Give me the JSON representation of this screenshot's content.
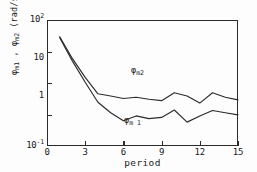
{
  "chart_data": {
    "type": "line",
    "title": "",
    "subtitle": "",
    "xlabel": "period",
    "ylabel": "φm1 , φm2 (rad/s)²",
    "yscale": "log",
    "xscale": "linear",
    "xlim": [
      0,
      15
    ],
    "ylim": [
      0.1,
      100
    ],
    "xticks": [
      0,
      3,
      6,
      9,
      12,
      15
    ],
    "xticklabels": [
      "0",
      "3",
      "6",
      "9",
      "12",
      "15"
    ],
    "yticks": [
      0.1,
      1,
      10,
      100
    ],
    "yticklabels": [
      "10-1",
      "1",
      "10",
      "102"
    ],
    "grid": false,
    "legend_position": "inline-annotation",
    "x": [
      1,
      2,
      3,
      4,
      5,
      6,
      7,
      8,
      9,
      10,
      11,
      12,
      13,
      14,
      15
    ],
    "series": [
      {
        "name": "φm2",
        "label": "φm2",
        "color": "#2b2b2b",
        "values": [
          40,
          12,
          4.3,
          1.75,
          1.55,
          1.35,
          1.45,
          1.3,
          1.2,
          1.85,
          1.55,
          1.05,
          1.85,
          1.45,
          1.25
        ]
      },
      {
        "name": "φm1",
        "label": "φm1",
        "color": "#2b2b2b",
        "values": [
          38,
          10.5,
          3.3,
          1.1,
          0.62,
          0.4,
          0.52,
          0.45,
          0.48,
          0.72,
          0.37,
          0.52,
          0.7,
          0.62,
          0.55
        ]
      }
    ],
    "annotations": [
      {
        "text": "φm2",
        "series": "φm2",
        "x": 7,
        "y": 2.6
      },
      {
        "text": "φm1",
        "series": "φm1",
        "x": 6.6,
        "y": 0.26
      }
    ]
  },
  "axes": {
    "x_axis_label": "period",
    "x_tick_labels": [
      "0",
      "3",
      "6",
      "9",
      "12",
      "15"
    ],
    "y_tick_labels": [
      {
        "mantissa": "10",
        "exponent": "2"
      },
      {
        "mantissa": "10",
        "exponent": ""
      },
      {
        "mantissa": "1",
        "exponent": ""
      },
      {
        "mantissa": "10",
        "exponent": "-1"
      }
    ],
    "y_axis_label": {
      "phi_1": "φ",
      "sub_1": "m1",
      "separator": " , ",
      "phi_2": "φ",
      "sub_2": "m2",
      "units": " (rad/s)",
      "units_exponent": "2"
    }
  },
  "curve_labels": {
    "upper": {
      "symbol": "φ",
      "subscript": "m2"
    },
    "lower": {
      "symbol": "φ",
      "subscript": "m 1"
    }
  },
  "colors": {
    "ink": "#2b2b2b",
    "background": "#fdfdfd",
    "curve": "#2b2b2b"
  }
}
